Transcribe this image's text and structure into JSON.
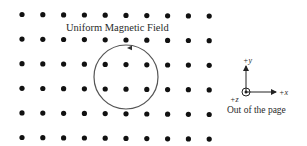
{
  "diagram": {
    "title": "Uniform Magnetic Field",
    "field_grid": {
      "rows": 6,
      "columns": 10,
      "symbol": "dot",
      "meaning": "field out of the page"
    },
    "loop": {
      "shape": "circle",
      "current_direction": "counterclockwise",
      "arrow_position": "top"
    },
    "axes": {
      "y_label": "+y",
      "x_label": "+x",
      "z_label": "+z",
      "z_symbol": "dot-in-circle",
      "caption": "Out of the page"
    },
    "colors": {
      "dots": "#111111",
      "loop": "#555555",
      "text": "#2a2a2a",
      "background": "#ffffff"
    }
  }
}
